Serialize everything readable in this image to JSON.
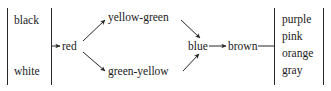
{
  "figure": {
    "kind": "directed-graph-diagram",
    "background_color": "#ffffff",
    "stroke_color": "#262626",
    "text_color": "#1a1a1a",
    "left_group": {
      "bracket_style": "two-vertical-rules",
      "items": [
        "black",
        "white"
      ]
    },
    "chain": {
      "nodes": [
        "red",
        "yellow-green",
        "green-yellow",
        "blue",
        "brown"
      ],
      "entry_label": "red",
      "exit_label": "brown"
    },
    "right_group": {
      "bracket_style": "two-vertical-rules",
      "items": [
        "purple",
        "pink",
        "orange",
        "gray"
      ]
    },
    "edges": [
      {
        "from": "left-group",
        "to": "red",
        "arrow": true
      },
      {
        "from": "red",
        "to": "yellow-green",
        "arrow": true
      },
      {
        "from": "red",
        "to": "green-yellow",
        "arrow": true
      },
      {
        "from": "yellow-green",
        "to": "blue",
        "arrow": true
      },
      {
        "from": "green-yellow",
        "to": "blue",
        "arrow": true
      },
      {
        "from": "blue",
        "to": "brown",
        "arrow": true
      },
      {
        "from": "brown",
        "to": "right-group",
        "arrow": false
      }
    ]
  }
}
